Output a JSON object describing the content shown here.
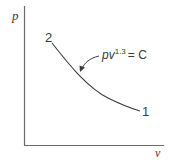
{
  "diagram": {
    "type": "p-v diagram",
    "axes": {
      "y_label": "p",
      "x_label": "v"
    },
    "curve": {
      "equation_base": "pv",
      "equation_exponent": "1.3",
      "equation_rhs": "= C",
      "start_point_label": "2",
      "end_point_label": "1"
    },
    "colors": {
      "line": "#3a3a3a",
      "axis": "#6a6a6a",
      "background": "#ffffff"
    }
  }
}
